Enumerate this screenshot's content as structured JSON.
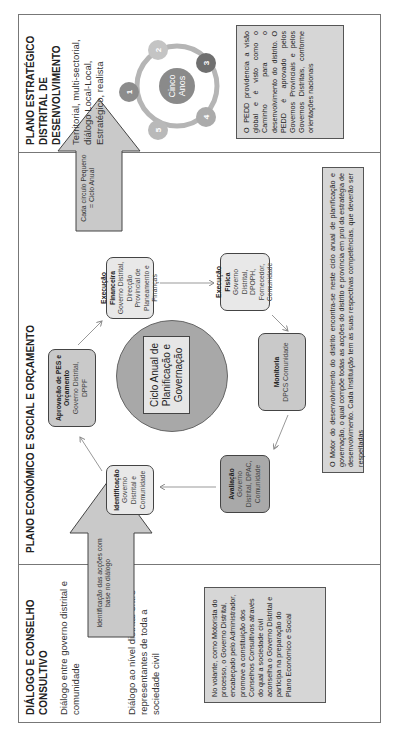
{
  "sections": {
    "dialogue": {
      "title": "DIÁLOGO E CONSELHO CONSULTIVO",
      "text1": "Diálogo entre governo distrital e comunidade",
      "text2": "Diálogo ao nível distrital entre representantes de toda a sociedade civil",
      "note": "No volante, como Motorista do processo, o Governo Distrital, encabeçado pelo Administrador, promove a constituição dos Conselhos Consultivos através do qual a sociedade civil aconselha o Governo Distrital e participa na preparação do Plano Económico e Social",
      "arrow_label": "Identificação das acções com base no diálogo"
    },
    "economic_plan": {
      "title": "PLANO ECONÓMICO E SOCIAL E ORÇAMENTO",
      "center_label": "Ciclo Anual de Planificação e Governação",
      "steps": [
        {
          "title": "Identificação",
          "detail": "Governo Distrital e Comunidade"
        },
        {
          "title": "Aprovação de PES e Orçamento",
          "detail": "Governo Distrital, DPPF"
        },
        {
          "title": "Execução Financeira",
          "detail": "Governo Distrital, Direcção Provincial de Planeamento e Finanças"
        },
        {
          "title": "Execução Física",
          "detail": "Governo Distrital, DPOPH, Fornecedor, Comunidade"
        },
        {
          "title": "Monitoria",
          "detail": "DPCS Comunidade"
        },
        {
          "title": "Avaliação",
          "detail": "Governo Distrital, DPAC, Comunidade"
        }
      ],
      "note": "O Motor do desenvolvimento do distrito encontra-se neste ciclo anual de planificação e governação, o qual compõe todas as acções do distrito e província em prol da estratégia de desenvolvimento. Cada Instituição tem as suas respectivas competências, que deverão ser respeitadas",
      "arrow_label": "Cada círculo Pequeno = Ciclo Anual"
    },
    "strategic_plan": {
      "title": "PLANO ESTRATÉGICO DISTRITAL DE DESENVOLVIMENTO",
      "text": "Territorial, multi-sectorial, diálogo Local-Local, Estratégico, realista",
      "cycle_center": "Cinco Anos",
      "cycle_nodes": [
        "1",
        "2",
        "3",
        "4",
        "5"
      ],
      "note": "O PEDD providencia a visão global e é visto como o Caminho para o desenvolvimento do distrito. O PEDD é aprovado pelos Governos Provinciais e pelos Governos Distritais, conforme orientações nacionais"
    }
  },
  "colors": {
    "node_1": "#8c8c8c",
    "node_2": "#c4c4c4",
    "node_3": "#6f6f6f",
    "node_4": "#ababab",
    "node_5": "#b9b9b9",
    "ring": "#b5b5b5",
    "note_bg": "#d6d6d6"
  }
}
